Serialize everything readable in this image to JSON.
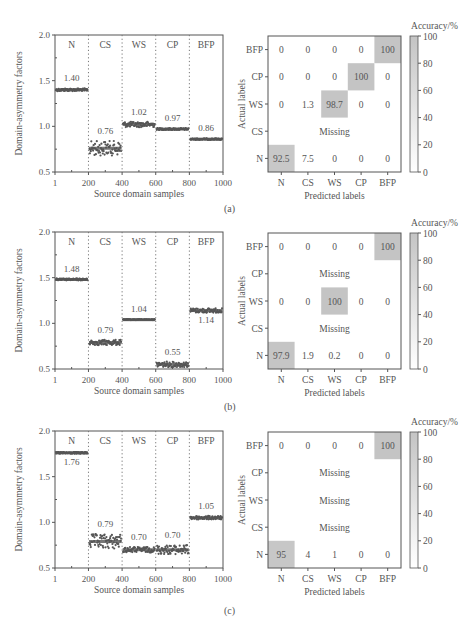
{
  "figure": {
    "panel_labels": [
      "(a)",
      "(b)",
      "(c)"
    ]
  },
  "colors": {
    "axis": "#555555",
    "points": "#555555",
    "divider": "#777777",
    "heat_high": "#c4c4c4",
    "heat_low": "#ffffff",
    "text": "#555555"
  },
  "chart_data": [
    {
      "panel": "(a)",
      "type": "scatter",
      "title": "",
      "xlabel": "Source domain samples",
      "ylabel": "Domain-asymmetry factors",
      "xlim": [
        1,
        1000
      ],
      "ylim": [
        0.5,
        2.0
      ],
      "xticks": [
        "1",
        "200",
        "400",
        "600",
        "800",
        "1000"
      ],
      "yticks": [
        "0.5",
        "1.0",
        "1.5",
        "2.0"
      ],
      "grid": false,
      "segments": [
        {
          "name": "N",
          "x": [
            1,
            200
          ],
          "mean": 1.4,
          "label": "1.40",
          "spread": 0.015,
          "label_pos": "above"
        },
        {
          "name": "CS",
          "x": [
            200,
            400
          ],
          "mean": 0.76,
          "label": "0.76",
          "spread": 0.08,
          "label_pos": "above"
        },
        {
          "name": "WS",
          "x": [
            400,
            600
          ],
          "mean": 1.02,
          "label": "1.02",
          "spread": 0.03,
          "label_pos": "above"
        },
        {
          "name": "CP",
          "x": [
            600,
            800
          ],
          "mean": 0.97,
          "label": "0.97",
          "spread": 0.01,
          "label_pos": "above"
        },
        {
          "name": "BFP",
          "x": [
            800,
            1000
          ],
          "mean": 0.86,
          "label": "0.86",
          "spread": 0.008,
          "label_pos": "above"
        }
      ]
    },
    {
      "panel": "(a)",
      "type": "heatmap",
      "title": "Accuracy/%",
      "xlabel": "Predicted labels",
      "ylabel": "Actual labels",
      "x_categories": [
        "N",
        "CS",
        "WS",
        "CP",
        "BFP"
      ],
      "y_categories": [
        "BFP",
        "CP",
        "WS",
        "CS",
        "N"
      ],
      "colorbar": {
        "label": "Accuracy/%",
        "ticks": [
          "0",
          "20",
          "40",
          "60",
          "80",
          "100"
        ],
        "range": [
          0,
          100
        ]
      },
      "rows": [
        {
          "actual": "BFP",
          "values": [
            "0",
            "0",
            "0",
            "0",
            "100"
          ]
        },
        {
          "actual": "CP",
          "values": [
            "0",
            "0",
            "0",
            "100",
            "0"
          ]
        },
        {
          "actual": "WS",
          "values": [
            "0",
            "1.3",
            "98.7",
            "0",
            "0"
          ]
        },
        {
          "actual": "CS",
          "missing": true,
          "text": "Missing"
        },
        {
          "actual": "N",
          "values": [
            "92.5",
            "7.5",
            "0",
            "0",
            "0"
          ]
        }
      ]
    },
    {
      "panel": "(b)",
      "type": "scatter",
      "title": "",
      "xlabel": "Source domain samples",
      "ylabel": "Domain-asymmetry factors",
      "xlim": [
        1,
        1000
      ],
      "ylim": [
        0.5,
        2.0
      ],
      "xticks": [
        "1",
        "200",
        "400",
        "600",
        "800",
        "1000"
      ],
      "yticks": [
        "0.5",
        "1.0",
        "1.5",
        "2.0"
      ],
      "grid": false,
      "segments": [
        {
          "name": "N",
          "x": [
            1,
            200
          ],
          "mean": 1.48,
          "label": "1.48",
          "spread": 0.01,
          "label_pos": "above"
        },
        {
          "name": "CS",
          "x": [
            200,
            400
          ],
          "mean": 0.79,
          "label": "0.79",
          "spread": 0.03,
          "label_pos": "above"
        },
        {
          "name": "WS",
          "x": [
            400,
            600
          ],
          "mean": 1.04,
          "label": "1.04",
          "spread": 0.005,
          "label_pos": "above"
        },
        {
          "name": "CP",
          "x": [
            600,
            800
          ],
          "mean": 0.55,
          "label": "0.55",
          "spread": 0.03,
          "label_pos": "above"
        },
        {
          "name": "BFP",
          "x": [
            800,
            1000
          ],
          "mean": 1.14,
          "label": "1.14",
          "spread": 0.025,
          "label_pos": "below"
        }
      ]
    },
    {
      "panel": "(b)",
      "type": "heatmap",
      "title": "Accuracy/%",
      "xlabel": "Predicted labels",
      "ylabel": "Actual labels",
      "x_categories": [
        "N",
        "CS",
        "WS",
        "CP",
        "BFP"
      ],
      "y_categories": [
        "BFP",
        "CP",
        "WS",
        "CS",
        "N"
      ],
      "colorbar": {
        "label": "Accuracy/%",
        "ticks": [
          "0",
          "20",
          "40",
          "60",
          "80",
          "100"
        ],
        "range": [
          0,
          100
        ]
      },
      "rows": [
        {
          "actual": "BFP",
          "values": [
            "0",
            "0",
            "0",
            "0",
            "100"
          ]
        },
        {
          "actual": "CP",
          "missing": true,
          "text": "Missing"
        },
        {
          "actual": "WS",
          "values": [
            "0",
            "0",
            "100",
            "0",
            "0"
          ]
        },
        {
          "actual": "CS",
          "missing": true,
          "text": "Missing"
        },
        {
          "actual": "N",
          "values": [
            "97.9",
            "1.9",
            "0.2",
            "0",
            "0"
          ]
        }
      ]
    },
    {
      "panel": "(c)",
      "type": "scatter",
      "title": "",
      "xlabel": "Source domain samples",
      "ylabel": "Domain-asymmetry factors",
      "xlim": [
        1,
        1000
      ],
      "ylim": [
        0.5,
        2.0
      ],
      "xticks": [
        "1",
        "200",
        "400",
        "600",
        "800",
        "1000"
      ],
      "yticks": [
        "0.5",
        "1.0",
        "1.5",
        "2.0"
      ],
      "grid": false,
      "segments": [
        {
          "name": "N",
          "x": [
            1,
            200
          ],
          "mean": 1.76,
          "label": "1.76",
          "spread": 0.01,
          "label_pos": "below"
        },
        {
          "name": "CS",
          "x": [
            200,
            400
          ],
          "mean": 0.79,
          "label": "0.79",
          "spread": 0.08,
          "label_pos": "above"
        },
        {
          "name": "WS",
          "x": [
            400,
            600
          ],
          "mean": 0.7,
          "label": "0.70",
          "spread": 0.03,
          "label_pos": "above"
        },
        {
          "name": "CP",
          "x": [
            600,
            800
          ],
          "mean": 0.7,
          "label": "0.70",
          "spread": 0.05,
          "label_pos": "above"
        },
        {
          "name": "BFP",
          "x": [
            800,
            1000
          ],
          "mean": 1.05,
          "label": "1.05",
          "spread": 0.02,
          "label_pos": "above"
        }
      ]
    },
    {
      "panel": "(c)",
      "type": "heatmap",
      "title": "Accuracy/%",
      "xlabel": "Predicted labels",
      "ylabel": "Actual labels",
      "x_categories": [
        "N",
        "CS",
        "WS",
        "CP",
        "BFP"
      ],
      "y_categories": [
        "BFP",
        "CP",
        "WS",
        "CS",
        "N"
      ],
      "colorbar": {
        "label": "Accuracy/%",
        "ticks": [
          "0",
          "20",
          "40",
          "60",
          "80",
          "100"
        ],
        "range": [
          0,
          100
        ]
      },
      "rows": [
        {
          "actual": "BFP",
          "values": [
            "0",
            "0",
            "0",
            "0",
            "100"
          ]
        },
        {
          "actual": "CP",
          "missing": true,
          "text": "Missing"
        },
        {
          "actual": "WS",
          "missing": true,
          "text": "Missing"
        },
        {
          "actual": "CS",
          "missing": true,
          "text": "Missing"
        },
        {
          "actual": "N",
          "values": [
            "95",
            "4",
            "1",
            "0",
            "0"
          ]
        }
      ]
    }
  ]
}
